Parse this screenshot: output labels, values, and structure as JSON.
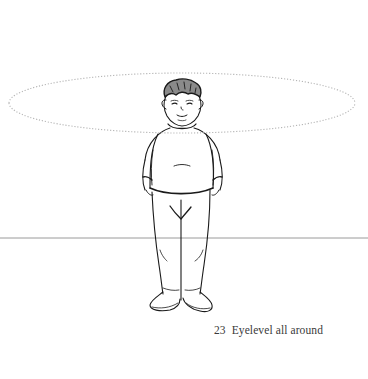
{
  "figure": {
    "number": "23",
    "caption": "Eyelevel all around",
    "colors": {
      "background": "#ffffff",
      "ink": "#1a1a1a",
      "horizon_line": "#9a9a9a",
      "eyelevel_ellipse": "#b5b5b5",
      "caption_text": "#3a3a3a"
    },
    "eyelevel_ellipse": {
      "style": "dotted",
      "cx": 182,
      "cy": 103,
      "rx": 173,
      "ry": 30
    },
    "horizon_line": {
      "y": 238
    }
  }
}
